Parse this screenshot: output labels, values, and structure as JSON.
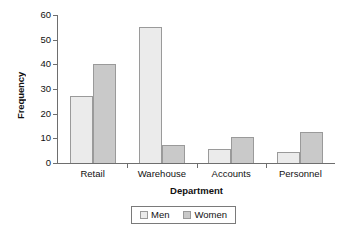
{
  "chart_data": {
    "type": "bar",
    "title": "",
    "xlabel": "Department",
    "ylabel": "Frequency",
    "categories": [
      "Retail",
      "Warehouse",
      "Accounts",
      "Personnel"
    ],
    "series": [
      {
        "name": "Men",
        "color": "#ebebeb",
        "values": [
          27,
          55,
          5.5,
          4.5
        ]
      },
      {
        "name": "Women",
        "color": "#c9c9c9",
        "values": [
          40,
          7.5,
          10.5,
          12.5
        ]
      }
    ],
    "ylim": [
      0,
      60
    ],
    "yticks": [
      0,
      10,
      20,
      30,
      40,
      50,
      60
    ],
    "ytick_labels": [
      "0",
      "10",
      "20",
      "30",
      "40",
      "50",
      "60"
    ],
    "grid": false,
    "legend_position": "bottom-center",
    "legend_entries": [
      "Men",
      "Women"
    ],
    "bar_border_color": "#9a9a9a",
    "axis_color": "#6e6e6e",
    "background": "#ffffff"
  }
}
